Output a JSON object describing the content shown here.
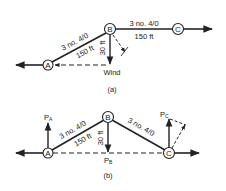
{
  "diagram_a": {
    "caption": "(a)",
    "nodes": {
      "A": "A",
      "B": "B",
      "C": "C"
    },
    "span_AB": {
      "conductor": "3 no. 4/0",
      "length": "150 ft"
    },
    "span_BC": {
      "conductor": "3 no. 4/0",
      "length": "150 ft"
    },
    "pole_height": "30 ft",
    "wind_label": "Wind"
  },
  "diagram_b": {
    "caption": "(b)",
    "nodes": {
      "A": "A",
      "B": "B",
      "C": "C"
    },
    "span_AB": {
      "conductor": "3 no. 4/0",
      "length": "150 ft"
    },
    "span_BC": {
      "conductor": "3 no. 4/0"
    },
    "pole_height": "30 ft",
    "loads": {
      "PA": "P",
      "PA_sub": "A",
      "PB": "P",
      "PB_sub": "B",
      "PC": "P",
      "PC_sub": "C"
    }
  },
  "colors": {
    "ink": "#222222",
    "background": "#ffffff"
  }
}
